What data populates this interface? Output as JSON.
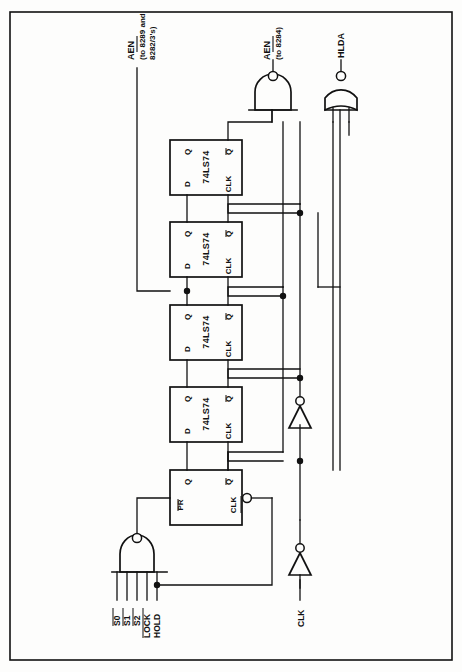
{
  "figure": {
    "type": "schematic",
    "border_color": "#111111",
    "wire_color": "#111111",
    "background": "#fdfdfc"
  },
  "outputs": [
    {
      "id": "aen_8289",
      "label": "AEN",
      "overbar": true,
      "sublabel_line1": "(to 8289 and",
      "sublabel_line2": "8282/3's)",
      "source": "flip-flop-2 D-node bus"
    },
    {
      "id": "aen_8284",
      "label": "AEN",
      "overbar": true,
      "sublabel_line1": "(to 8284)",
      "sublabel_line2": "",
      "source": "nand-gate-aen"
    },
    {
      "id": "hlda",
      "label": "HLDA",
      "overbar": false,
      "sublabel_line1": "",
      "sublabel_line2": "",
      "source": "nor-gate-hlda"
    }
  ],
  "inputs": [
    {
      "id": "s0",
      "label": "S0",
      "overbar": true
    },
    {
      "id": "s1",
      "label": "S1",
      "overbar": true
    },
    {
      "id": "s2",
      "label": "S2",
      "overbar": true
    },
    {
      "id": "lock",
      "label": "LOCK",
      "overbar": true
    },
    {
      "id": "hold",
      "label": "HOLD",
      "overbar": false
    },
    {
      "id": "clk",
      "label": "CLK",
      "overbar": false
    }
  ],
  "flipflops": [
    {
      "id": "ff1",
      "part": "74LS74",
      "pins": {
        "q": "Q",
        "qbar": "Q",
        "d": "D",
        "clk": "CLK"
      },
      "qbar_overbar": true,
      "position": "top"
    },
    {
      "id": "ff2",
      "part": "74LS74",
      "pins": {
        "q": "Q",
        "qbar": "Q",
        "d": "D",
        "clk": "CLK"
      },
      "qbar_overbar": true,
      "position": "second"
    },
    {
      "id": "ff3",
      "part": "74LS74",
      "pins": {
        "q": "Q",
        "qbar": "Q",
        "d": "D",
        "clk": "CLK"
      },
      "qbar_overbar": true,
      "position": "third"
    },
    {
      "id": "ff4",
      "part": "74LS74",
      "pins": {
        "q": "Q",
        "qbar": "Q",
        "d": "D",
        "clk": "CLK"
      },
      "qbar_overbar": true,
      "position": "fourth"
    },
    {
      "id": "ff5",
      "part": "",
      "pins": {
        "q": "Q",
        "qbar": "Q",
        "d": "PR",
        "clk": "CLK"
      },
      "qbar_overbar": true,
      "clk_inverted": true,
      "position": "bottom"
    }
  ],
  "gates": [
    {
      "id": "nand-aen",
      "type": "NAND",
      "inputs": 2,
      "bubble": true,
      "output": "AEN (to 8284)"
    },
    {
      "id": "nor-hlda",
      "type": "NOR",
      "inputs": 2,
      "bubble": true,
      "output": "HLDA"
    },
    {
      "id": "nand-status",
      "type": "NAND",
      "inputs": 5,
      "bubble": true,
      "output": "PR of bottom flip-flop"
    },
    {
      "id": "inv-clk-1",
      "type": "INVERTER",
      "bubble": true,
      "output": "clock bus upper"
    },
    {
      "id": "inv-clk-2",
      "type": "INVERTER",
      "bubble": true,
      "output": "clock bus lower"
    }
  ]
}
